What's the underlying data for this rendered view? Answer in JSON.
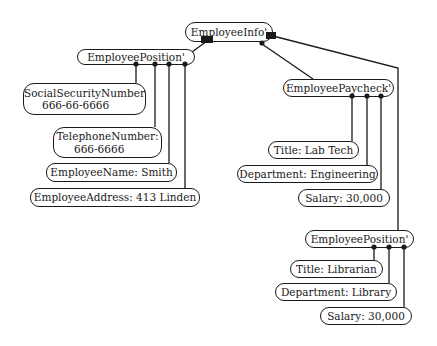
{
  "colors": {
    "line": "#1a1a1a",
    "background": "#ffffff"
  },
  "nodes": {
    "employee_info": {
      "label": "EmployeeInfo'"
    },
    "employee_position_left": {
      "label": "EmployeePosition'"
    },
    "ssn": {
      "label": "SocialSecurityNumber",
      "value": "666-66-6666"
    },
    "telephone": {
      "label": "TelephoneNumber:",
      "value": "666-6666"
    },
    "employee_name": {
      "label": "EmployeeName:  Smith"
    },
    "employee_address": {
      "label": "EmployeeAddress:  413  Linden"
    },
    "employee_paycheck": {
      "label": "EmployeePaycheck'"
    },
    "paycheck_title": {
      "label": "Title:  Lab Tech"
    },
    "paycheck_department": {
      "label": "Department:  Engineering"
    },
    "paycheck_salary": {
      "label": "Salary:  30,000"
    },
    "employee_position_right": {
      "label": "EmployeePosition'"
    },
    "position_title": {
      "label": "Title:  Librarian"
    },
    "position_department": {
      "label": "Department:  Library"
    },
    "position_salary": {
      "label": "Salary:  30,000"
    }
  },
  "connector_icons": {
    "employee_info_left": "filled-square-port",
    "employee_info_right": "filled-square-port",
    "employee_info_bottom": "filled-dot-port"
  }
}
